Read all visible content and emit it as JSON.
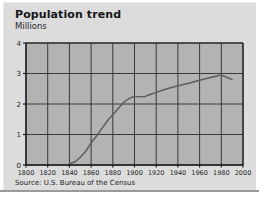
{
  "figure": {
    "title": "Population trend",
    "source": "Source: U.S. Bureau of the Census",
    "colors": {
      "card_background": "#dcdcdc",
      "plot_background": "#b3b3b3",
      "grid": "#3a3a3e",
      "axis": "#1c1c1f",
      "line": "#5d5d62",
      "page_background": "#ffffff"
    }
  },
  "chart_data": {
    "type": "line",
    "title": "Population trend",
    "subtitle": "Millions",
    "xlabel": "",
    "ylabel": "Millions",
    "xlim": [
      1800,
      2000
    ],
    "ylim": [
      0,
      4
    ],
    "grid": true,
    "legend": "none",
    "xticks": [
      1800,
      1820,
      1840,
      1860,
      1880,
      1900,
      1920,
      1940,
      1960,
      1980,
      2000
    ],
    "yticks": [
      0,
      1,
      2,
      3,
      4
    ],
    "xtick_labels": [
      "1800",
      "1820",
      "1840",
      "1860",
      "1880",
      "1900",
      "1920",
      "1940",
      "1960",
      "1980",
      "2000"
    ],
    "ytick_labels": [
      "0",
      "1",
      "2",
      "3",
      "4"
    ],
    "series": [
      {
        "name": "Population",
        "units": "Millions",
        "x": [
          1840,
          1845,
          1850,
          1855,
          1860,
          1865,
          1870,
          1875,
          1880,
          1885,
          1890,
          1895,
          1900,
          1905,
          1910,
          1915,
          1920,
          1930,
          1940,
          1950,
          1960,
          1970,
          1980,
          1990
        ],
        "y": [
          0.05,
          0.1,
          0.25,
          0.45,
          0.72,
          0.95,
          1.2,
          1.45,
          1.65,
          1.85,
          2.05,
          2.18,
          2.25,
          2.24,
          2.25,
          2.32,
          2.38,
          2.5,
          2.6,
          2.68,
          2.78,
          2.87,
          2.95,
          2.8
        ]
      }
    ]
  },
  "plot_geometry": {
    "left": 23,
    "top": 41,
    "width": 217,
    "height": 122
  }
}
